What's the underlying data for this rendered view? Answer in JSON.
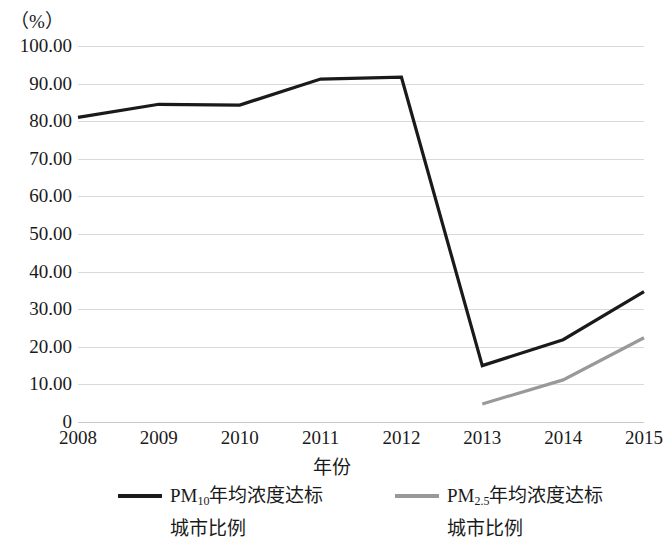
{
  "chart_data": {
    "type": "line",
    "title": "",
    "xlabel": "年份",
    "ylabel": "（%）",
    "unit_label": "（%）",
    "categories": [
      "2008",
      "2009",
      "2010",
      "2011",
      "2012",
      "2013",
      "2014",
      "2015"
    ],
    "ylim": [
      0,
      100
    ],
    "ytick_labels": [
      "100.00",
      "90.00",
      "80.00",
      "70.00",
      "60.00",
      "50.00",
      "40.00",
      "30.00",
      "20.00",
      "10.00",
      "0"
    ],
    "ytick_values": [
      100,
      90,
      80,
      70,
      60,
      50,
      40,
      30,
      20,
      10,
      0
    ],
    "grid": true,
    "legend_position": "bottom",
    "series": [
      {
        "name": "PM10年均浓度达标城市比例",
        "name_prefix": "PM",
        "name_sub": "10",
        "name_line1": "年均浓度达标",
        "name_line2": "城市比例",
        "color": "#1a1a1a",
        "values": [
          81.0,
          84.5,
          84.3,
          91.2,
          91.7,
          15.0,
          21.9,
          34.7
        ]
      },
      {
        "name": "PM2.5年均浓度达标城市比例",
        "name_prefix": "PM",
        "name_sub": "2.5",
        "name_line1": "年均浓度达标",
        "name_line2": "城市比例",
        "color": "#999999",
        "values": [
          null,
          null,
          null,
          null,
          null,
          4.8,
          11.2,
          22.4
        ]
      }
    ]
  }
}
